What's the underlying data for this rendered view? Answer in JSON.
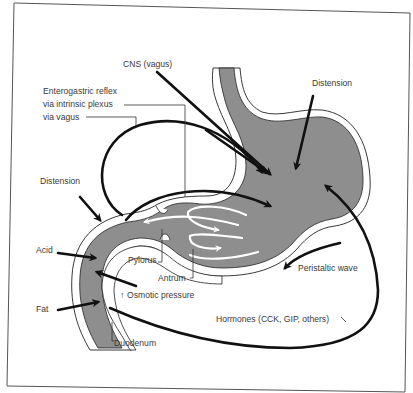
{
  "figure": {
    "colors": {
      "background": "#ffffff",
      "lumen": "#8e8e8e",
      "wall": "#ffffff",
      "arrows": "#111111",
      "frame": "#555555",
      "text": "#3a3a3a"
    }
  },
  "labels": {
    "cns_vagus": "CNS (vagus)",
    "enterogastric_reflex": "Enterogastric reflex",
    "via_intrinsic_plexus": "via intrinsic plexus",
    "via_vagus": "via vagus",
    "distension_stomach": "Distension",
    "distension_duodenum": "Distension",
    "acid": "Acid",
    "fat": "Fat",
    "pylorus": "Pylorus",
    "antrum": "Antrum",
    "osmotic_pressure": "Osmotic pressure",
    "osmotic_arrow": "↑",
    "duodenum": "Duodenum",
    "peristaltic_wave": "Peristaltic wave",
    "hormones": "Hormones (CCK, GIP, others)"
  }
}
